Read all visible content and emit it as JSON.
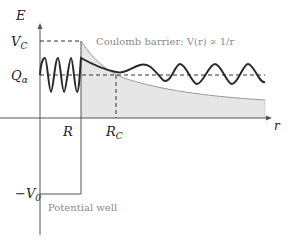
{
  "diagram": {
    "axes": {
      "y_label": "E",
      "x_label": "r"
    },
    "levels": {
      "barrier_height": "V",
      "barrier_height_sub": "C",
      "q_value": "Q",
      "q_value_sub": "α",
      "well_depth": "−V",
      "well_depth_sub": "0"
    },
    "radii": {
      "nuclear_radius": "R",
      "coulomb_radius": "R",
      "coulomb_radius_sub": "C"
    },
    "annotations": {
      "coulomb": "Coulomb barrier: V(r) ∝ 1/r",
      "well": "Potential well"
    },
    "colors": {
      "axis": "#555555",
      "wave": "#2a2a2a",
      "barrier_fill": "#e6e6e6",
      "barrier_edge": "#9a9a9a",
      "annotation": "#8a8a8a"
    }
  }
}
